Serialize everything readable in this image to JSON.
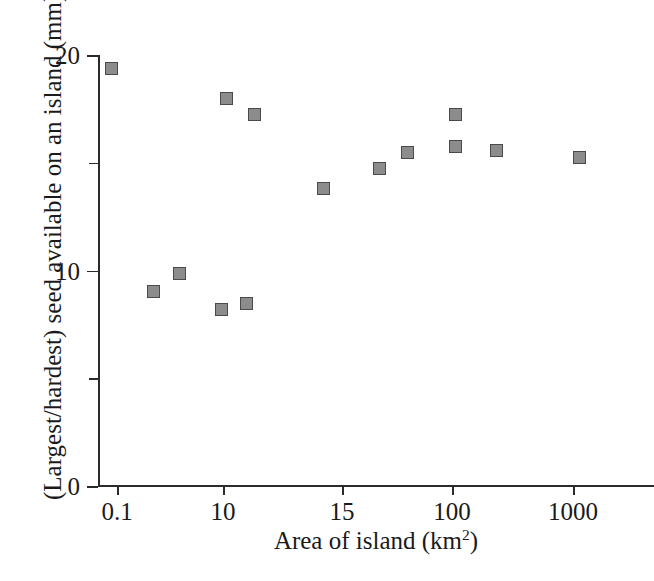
{
  "chart_data": {
    "type": "scatter",
    "title": "",
    "xlabel": "Area of island (km²)",
    "xlabel_base": "Area of island (km",
    "xlabel_sup": "2",
    "xlabel_tail": ")",
    "ylabel": "(Largest/hardest) seed available on an island (mm)",
    "grid": false,
    "legend": "none",
    "xscale": "log-like-ordinal",
    "x_tick_labels": [
      "0.1",
      "10",
      "15",
      "100",
      "1000"
    ],
    "x_tick_positions_px": [
      19,
      125,
      244,
      354,
      475
    ],
    "y_tick_labels": [
      "0",
      "10",
      "20"
    ],
    "y_major_values": [
      0,
      10,
      20
    ],
    "y_minor_values": [
      5,
      15
    ],
    "ylim": [
      0,
      20
    ],
    "marker_fill": "#8c8c8c",
    "marker_edge": "#4a4a4a",
    "axis_color": "#2b2b2b",
    "points": [
      {
        "label": "p1",
        "x_px": 12,
        "y": 19.4
      },
      {
        "label": "p2",
        "x_px": 54,
        "y": 9.05
      },
      {
        "label": "p3",
        "x_px": 80,
        "y": 9.9
      },
      {
        "label": "p4",
        "x_px": 122,
        "y": 8.25
      },
      {
        "label": "p5",
        "x_px": 127,
        "y": 18.05
      },
      {
        "label": "p6",
        "x_px": 147,
        "y": 8.5
      },
      {
        "label": "p7",
        "x_px": 155,
        "y": 17.3
      },
      {
        "label": "p8",
        "x_px": 224,
        "y": 13.85
      },
      {
        "label": "p9",
        "x_px": 280,
        "y": 14.8
      },
      {
        "label": "p10",
        "x_px": 308,
        "y": 15.5
      },
      {
        "label": "p11",
        "x_px": 356,
        "y": 17.3
      },
      {
        "label": "p12",
        "x_px": 356,
        "y": 15.8
      },
      {
        "label": "p13",
        "x_px": 397,
        "y": 15.6
      },
      {
        "label": "p14",
        "x_px": 480,
        "y": 15.3
      }
    ]
  }
}
